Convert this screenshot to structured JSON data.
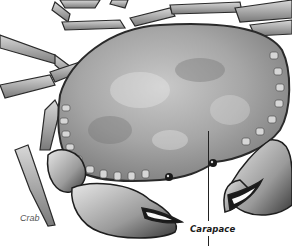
{
  "figure": {
    "style": "grayscale engraving",
    "labels": {
      "species": "Crab",
      "part": "Carapace"
    },
    "colors": {
      "background": "#ffffff",
      "shell_fill": "#a8a8a8",
      "outline": "#2a2a2a",
      "label_species": "#555555",
      "label_part": "#1a1a1a"
    }
  }
}
